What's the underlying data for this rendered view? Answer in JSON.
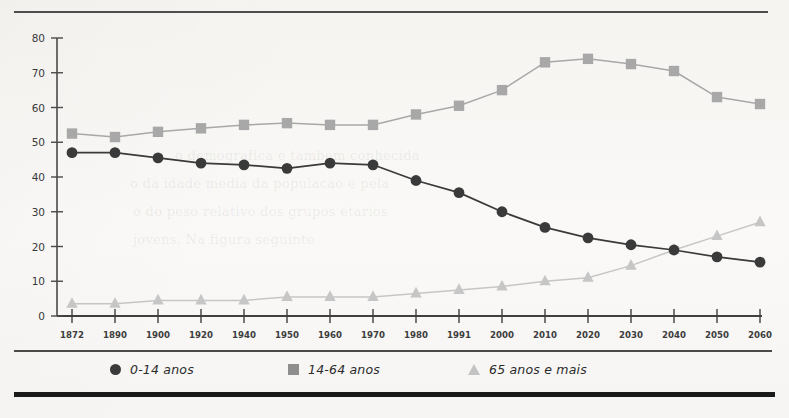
{
  "legend": {
    "entries": [
      {
        "label": "0-14 anos",
        "marker": "circle-marker-icon",
        "color": "#3a3a3a"
      },
      {
        "label": "14-64 anos",
        "marker": "square-marker-icon",
        "color": "#8e8e8e"
      },
      {
        "label": "65 anos e mais",
        "marker": "triangle-marker-icon",
        "color": "#c3c3c3"
      }
    ]
  },
  "chart_data": {
    "type": "line",
    "title": "",
    "xlabel": "",
    "ylabel": "",
    "ylim": [
      0,
      80
    ],
    "ytick_labels": [
      "0",
      "10",
      "20",
      "30",
      "40",
      "50",
      "60",
      "70",
      "80"
    ],
    "yticks": [
      0,
      10,
      20,
      30,
      40,
      50,
      60,
      70,
      80
    ],
    "grid": false,
    "legend_position": "bottom",
    "categories": [
      "1872",
      "1890",
      "1900",
      "1920",
      "1940",
      "1950",
      "1960",
      "1970",
      "1980",
      "1991",
      "2000",
      "2010",
      "2020",
      "2030",
      "2040",
      "2050",
      "2060"
    ],
    "series": [
      {
        "name": "0-14 anos",
        "color": "#3a3a3a",
        "marker": "circle",
        "values": [
          47,
          47,
          45.5,
          44,
          43.5,
          42.5,
          44,
          43.5,
          39,
          35.5,
          30,
          25.5,
          22.5,
          20.5,
          19,
          17,
          15.5
        ]
      },
      {
        "name": "14-64 anos",
        "color": "#a8a8a8",
        "marker": "square",
        "values": [
          52.5,
          51.5,
          53,
          54,
          55,
          55.5,
          55,
          55,
          58,
          60.5,
          65,
          73,
          74,
          72.5,
          70.5,
          63,
          61
        ]
      },
      {
        "name": "65 anos e mais",
        "color": "#c6c6c6",
        "marker": "triangle",
        "values": [
          3.5,
          3.5,
          4.5,
          4.5,
          4.5,
          5.5,
          5.5,
          5.5,
          6.5,
          7.5,
          8.5,
          10,
          11,
          14.5,
          19,
          23,
          27
        ]
      }
    ]
  },
  "background_text": {
    "lines": [
      "o demografica e tambem conhecida",
      "o da idade media da populacao e pela",
      "o do peso relativo dos grupos etarios",
      "jovens. Na figura seguinte"
    ]
  }
}
